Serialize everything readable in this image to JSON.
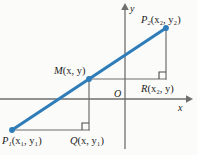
{
  "figure": {
    "type": "coordinate-geometry-diagram",
    "background_color": "#fbfbfa",
    "colors": {
      "segment": "#2e7cb8",
      "axis": "#6e6e6e",
      "construction": "#6e6e6e",
      "text": "#1b1b1b"
    }
  },
  "axes": {
    "x_label": "x",
    "y_label": "y",
    "origin_label": "O",
    "x_axis": {
      "y_px": 99,
      "x_start_px": 0,
      "x_end_px": 191,
      "arrow": "right"
    },
    "y_axis": {
      "x_px": 125,
      "y_start_px": 5,
      "y_end_px": 149,
      "arrow": "up"
    }
  },
  "points": [
    {
      "id": "P1",
      "label": "P",
      "subscript": "1",
      "coords": "(x₁, y₁)",
      "coord_x": "x",
      "coord_x_sub": "1",
      "coord_y": "y",
      "coord_y_sub": "1",
      "px": 12,
      "py": 130,
      "marker": "filled-dot"
    },
    {
      "id": "M",
      "label": "M",
      "subscript": "",
      "coords": "(x, y)",
      "coord_x": "x",
      "coord_x_sub": "",
      "coord_y": "y",
      "coord_y_sub": "",
      "px": 89,
      "py": 79,
      "marker": "filled-dot"
    },
    {
      "id": "P2",
      "label": "P",
      "subscript": "2",
      "coords": "(x₂, y₂)",
      "coord_x": "x",
      "coord_x_sub": "2",
      "coord_y": "y",
      "coord_y_sub": "2",
      "px": 166,
      "py": 28,
      "marker": "filled-dot"
    },
    {
      "id": "Q",
      "label": "Q",
      "subscript": "",
      "coords": "(x, y₁)",
      "coord_x": "x",
      "coord_x_sub": "",
      "coord_y": "y",
      "coord_y_sub": "1",
      "px": 89,
      "py": 130,
      "marker": "right-angle"
    },
    {
      "id": "R",
      "label": "R",
      "subscript": "",
      "coords": "(x₂, y)",
      "coord_x": "x",
      "coord_x_sub": "2",
      "coord_y": "y",
      "coord_y_sub": "",
      "px": 166,
      "py": 79,
      "marker": "right-angle"
    }
  ],
  "segment": {
    "from": "P1",
    "to": "P2",
    "color": "#2e7cb8",
    "width_px": 3
  },
  "construction_lines": [
    {
      "from": "P1",
      "to": "Q",
      "orientation": "horizontal"
    },
    {
      "from": "Q",
      "to": "M",
      "orientation": "vertical"
    },
    {
      "from": "M",
      "to": "R",
      "orientation": "horizontal"
    },
    {
      "from": "R",
      "to": "P2",
      "orientation": "vertical"
    }
  ],
  "right_angle_markers": [
    {
      "at": "Q",
      "size_px": 7
    },
    {
      "at": "R",
      "size_px": 7
    }
  ]
}
